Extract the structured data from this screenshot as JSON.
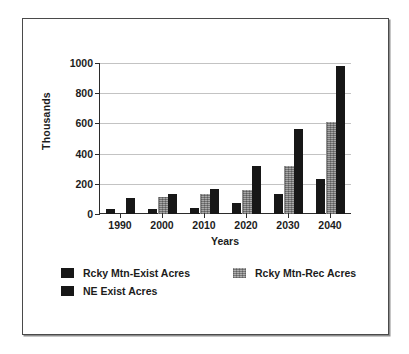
{
  "chart_data": {
    "type": "bar",
    "title": "",
    "xlabel": "Years",
    "ylabel": "Thousands",
    "categories": [
      "1990",
      "2000",
      "2010",
      "2020",
      "2030",
      "2040"
    ],
    "series": [
      {
        "name": "Rcky Mtn-Exist Acres",
        "color": "#171717",
        "pattern": "solid-black",
        "values": [
          30,
          35,
          40,
          70,
          135,
          235
        ]
      },
      {
        "name": "Rcky Mtn-Rec Acres",
        "color": "#a8a8a8",
        "pattern": "gray-stipple",
        "values": [
          0,
          115,
          130,
          160,
          320,
          610
        ]
      },
      {
        "name": "NE Exist Acres",
        "color": "#171717",
        "pattern": "solid-black",
        "values": [
          105,
          130,
          165,
          320,
          565,
          980
        ]
      }
    ],
    "ylim": [
      0,
      1000
    ],
    "y_ticks": [
      0,
      200,
      400,
      600,
      800,
      1000
    ],
    "grid": true,
    "legend_position": "bottom"
  },
  "legend": {
    "entries": [
      {
        "label": "Rcky Mtn-Exist Acres"
      },
      {
        "label": "Rcky Mtn-Rec Acres"
      },
      {
        "label": "NE Exist Acres"
      }
    ]
  }
}
